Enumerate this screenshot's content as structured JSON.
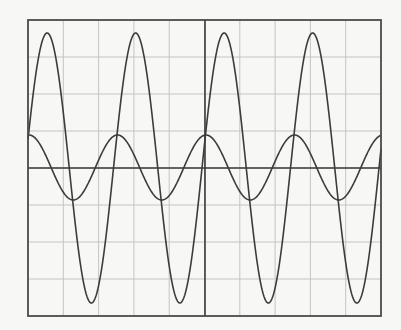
{
  "chart_data": {
    "type": "line",
    "title": "",
    "xlabel": "",
    "ylabel": "",
    "grid": true,
    "grid_divisions": {
      "x": 10,
      "y": 8
    },
    "legend": null,
    "xlim": [
      0,
      10
    ],
    "ylim": [
      -4,
      4
    ],
    "x_unit": "divisions",
    "y_unit": "divisions",
    "series": [
      {
        "name": "large-amplitude sine",
        "shape": "sine",
        "amplitude_div": 3.66,
        "period_div": 2.5,
        "offset_div": 0,
        "zero_crossing_rising_div": 4.9,
        "peaks_x_div": [
          0.54,
          3.03,
          5.54,
          8.04
        ],
        "troughs_x_div": [
          1.78,
          4.28,
          6.78,
          9.25
        ]
      },
      {
        "name": "small-amplitude cosine",
        "shape": "cosine",
        "amplitude_div": 0.88,
        "period_div": 2.5,
        "offset_div": 0,
        "peak_phase_x_div": 5.0,
        "peaks_x_div": [
          0.0,
          2.5,
          5.0,
          7.5,
          10.0
        ],
        "troughs_x_div": [
          1.25,
          3.75,
          6.25,
          8.75
        ]
      }
    ]
  },
  "render": {
    "frame": {
      "left": 28,
      "top": 20,
      "right": 381,
      "bottom": 316
    },
    "axis_y": 168,
    "center_x": 205,
    "colors": {
      "background": "#f7f7f5",
      "grid": "#c4c4c4",
      "frame": "#4a4a4a",
      "axis": "#3a3a3a",
      "trace": "#3c3c3c"
    },
    "traces": [
      {
        "id": "large",
        "amp_px": 135,
        "period_px": 88.5,
        "phase_x": 202,
        "func": "sin",
        "mid_y": 168
      },
      {
        "id": "small",
        "amp_px": 32.5,
        "period_px": 88.5,
        "phase_x": 206,
        "func": "cos",
        "mid_y": 167.5
      }
    ]
  }
}
